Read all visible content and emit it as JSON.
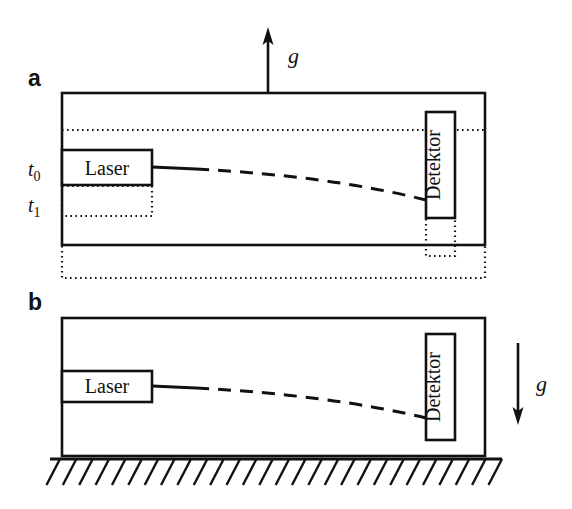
{
  "figure": {
    "type": "physics-diagram",
    "background_color": "#ffffff",
    "line_color": "#111111",
    "width": 572,
    "height": 509
  },
  "panels": [
    {
      "id": "a",
      "letter": "a",
      "box": {
        "x": 62,
        "y": 93,
        "width": 423,
        "height": 152
      },
      "gravity_arrow": {
        "label": "g",
        "direction": "up",
        "x": 268,
        "y_tail": 93,
        "y_head": 31,
        "label_x": 288,
        "label_y": 62
      },
      "time_labels": [
        {
          "text": "t",
          "sub": "0",
          "x": 28,
          "y": 175
        },
        {
          "text": "t",
          "sub": "1",
          "x": 28,
          "y": 210
        }
      ],
      "laser": {
        "label": "Laser",
        "x": 62,
        "y": 150,
        "width": 90,
        "height": 35,
        "orientation": "horizontal"
      },
      "laser_ghost": {
        "x": 62,
        "y": 186,
        "width": 90,
        "height": 30,
        "style": "dotted"
      },
      "detector": {
        "label": "Detektor",
        "x": 426,
        "y": 112,
        "width": 29,
        "height": 106,
        "orientation": "vertical"
      },
      "detector_ghost": {
        "x": 426,
        "y": 219,
        "width": 29,
        "height": 37,
        "style": "dotted"
      },
      "reference_line": {
        "y": 130,
        "x_start": 62,
        "x_end": 485,
        "style": "dotted"
      },
      "box_ghost": {
        "x": 62,
        "y": 246,
        "width": 423,
        "height": 32,
        "style": "dotted"
      },
      "beam": {
        "style": "dashed-curve",
        "start_x": 152,
        "start_y": 167,
        "end_x": 426,
        "end_y": 200,
        "curvature": "downward"
      }
    },
    {
      "id": "b",
      "letter": "b",
      "box": {
        "x": 62,
        "y": 318,
        "width": 423,
        "height": 138
      },
      "gravity_arrow": {
        "label": "g",
        "direction": "down",
        "x": 518,
        "y_tail": 343,
        "y_head": 424,
        "label_x": 536,
        "label_y": 390
      },
      "laser": {
        "label": "Laser",
        "x": 62,
        "y": 371,
        "width": 90,
        "height": 31,
        "orientation": "horizontal"
      },
      "detector": {
        "label": "Detektor",
        "x": 426,
        "y": 334,
        "width": 29,
        "height": 106,
        "orientation": "vertical"
      },
      "beam": {
        "style": "dashed-curve",
        "start_x": 152,
        "start_y": 385,
        "end_x": 426,
        "end_y": 418,
        "curvature": "downward"
      },
      "ground": {
        "y": 458,
        "x_start": 50,
        "x_end": 502,
        "hatch_count": 28,
        "hatch_angle": "down-left",
        "hatch_length": 26
      }
    }
  ],
  "text_items": {
    "panel_a_letter": "a",
    "panel_b_letter": "b",
    "laser_label": "Laser",
    "detector_label": "Detektor",
    "gravity_label": "g",
    "time_zero": "t",
    "time_zero_sub": "0",
    "time_one": "t",
    "time_one_sub": "1"
  }
}
